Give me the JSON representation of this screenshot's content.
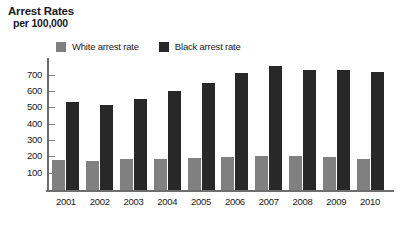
{
  "title": {
    "line1": "Arrest Rates",
    "line2": "per 100,000"
  },
  "legend": {
    "position": "top-left-inside",
    "entries": [
      {
        "label": "White arrest rate",
        "color": "#808080"
      },
      {
        "label": "Black arrest rate",
        "color": "#282828"
      }
    ]
  },
  "colors": {
    "white_arrest_rate": "#808080",
    "black_arrest_rate": "#282828",
    "axis": "#6d6d6d",
    "text": "#1a1a1a",
    "background": "#ffffff"
  },
  "axes": {
    "y_ticks": [
      "700",
      "600",
      "500",
      "400",
      "300",
      "200",
      "100"
    ],
    "x_ticks": [
      "2001",
      "2002",
      "2003",
      "2004",
      "2005",
      "2006",
      "2007",
      "2008",
      "2009",
      "2010"
    ]
  },
  "chart_data": {
    "type": "bar",
    "title": "Arrest Rates per 100,000",
    "xlabel": "",
    "ylabel": "per 100,000",
    "categories": [
      "2001",
      "2002",
      "2003",
      "2004",
      "2005",
      "2006",
      "2007",
      "2008",
      "2009",
      "2010"
    ],
    "series": [
      {
        "name": "White arrest rate",
        "color": "#808080",
        "values": [
          186,
          180,
          188,
          193,
          196,
          203,
          210,
          207,
          203,
          193
        ]
      },
      {
        "name": "Black arrest rate",
        "color": "#282828",
        "values": [
          541,
          519,
          555,
          607,
          655,
          715,
          760,
          733,
          737,
          722
        ]
      }
    ],
    "ylim": [
      0,
      790
    ],
    "yticks": [
      100,
      200,
      300,
      400,
      500,
      600,
      700
    ],
    "grid": false,
    "legend_position": "top-left"
  }
}
